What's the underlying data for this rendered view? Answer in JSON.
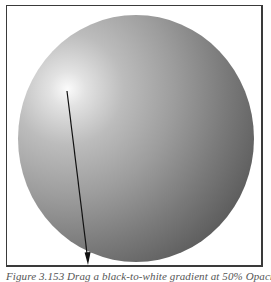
{
  "figure": {
    "caption": "Figure 3.153 Drag a black-to-white gradient at 50% Opacity i",
    "illustration": "radial-gradient-sphere",
    "arrow": {
      "from": [
        67,
        91
      ],
      "to": [
        88,
        264
      ],
      "meaning": "gradient drag direction"
    },
    "colors": {
      "highlight": "#fbfbfb",
      "midtone": "#9d9d9d",
      "shadow": "#4e4e4e",
      "frame": "#3a3a3a",
      "arrow": "#111111",
      "caption": "#555555"
    }
  }
}
